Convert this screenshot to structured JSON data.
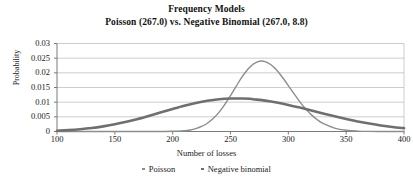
{
  "chart_data": {
    "type": "line",
    "title": "Frequency Models",
    "subtitle": "Poisson (267.0) vs. Negative Binomial (267.0, 8.8)",
    "xlabel": "Number of losses",
    "ylabel": "Probability",
    "xlim": [
      100,
      400
    ],
    "ylim": [
      0,
      0.03
    ],
    "xticks": [
      100,
      150,
      200,
      250,
      300,
      350,
      400
    ],
    "yticks": [
      0,
      0.005,
      0.01,
      0.015,
      0.02,
      0.025,
      0.03
    ],
    "ytick_labels": [
      "0",
      "0.005",
      "0.01",
      "0.015",
      "0.02",
      "0.025",
      "0.03"
    ],
    "xtick_labels": [
      "100",
      "150",
      "200",
      "250",
      "300",
      "350",
      "400"
    ],
    "grid": "horizontal",
    "legend_position": "bottom",
    "series": [
      {
        "name": "Poisson",
        "color": "#8d8d8d",
        "linewidth": 1.4,
        "mean": 267.0,
        "peak_x": 267,
        "peak_y": 0.0245,
        "x": [
          100,
          110,
          120,
          130,
          140,
          150,
          160,
          170,
          180,
          190,
          200,
          205,
          210,
          215,
          220,
          225,
          230,
          235,
          240,
          245,
          250,
          255,
          260,
          265,
          267,
          270,
          275,
          280,
          285,
          290,
          295,
          300,
          305,
          310,
          315,
          320,
          325,
          330,
          340,
          350,
          360,
          370,
          380,
          390,
          400
        ],
        "y": [
          0.0,
          0.0,
          0.0,
          0.0,
          0.0,
          0.0,
          0.0,
          0.0,
          0.0,
          1e-05,
          6e-05,
          0.00013,
          0.00027,
          0.00053,
          0.00098,
          0.00171,
          0.00282,
          0.00441,
          0.00653,
          0.00917,
          0.01223,
          0.01548,
          0.01861,
          0.02124,
          0.02199,
          0.02306,
          0.02395,
          0.02383,
          0.02275,
          0.02087,
          0.01841,
          0.01564,
          0.01281,
          0.01012,
          0.00771,
          0.00567,
          0.00402,
          0.00275,
          0.00117,
          0.00043,
          0.00014,
          4e-05,
          1e-05,
          0.0,
          0.0
        ]
      },
      {
        "name": "Negative binomial",
        "color": "#6f6f6f",
        "linewidth": 2.6,
        "mean": 267.0,
        "dispersion": 8.8,
        "peak_x": 267,
        "peak_y": 0.0112,
        "x": [
          100,
          110,
          120,
          130,
          140,
          150,
          160,
          170,
          180,
          190,
          200,
          210,
          220,
          230,
          240,
          250,
          260,
          267,
          270,
          280,
          290,
          300,
          310,
          320,
          330,
          340,
          350,
          360,
          370,
          380,
          390,
          400
        ],
        "y": [
          0.00028,
          0.00048,
          0.00078,
          0.00119,
          0.00175,
          0.00245,
          0.00331,
          0.0043,
          0.0054,
          0.00655,
          0.0077,
          0.00879,
          0.00974,
          0.01049,
          0.011,
          0.01125,
          0.01124,
          0.01114,
          0.01099,
          0.01052,
          0.00987,
          0.00906,
          0.00815,
          0.00717,
          0.00617,
          0.00519,
          0.00427,
          0.00343,
          0.0027,
          0.00207,
          0.00155,
          0.00114
        ]
      }
    ]
  },
  "legend": {
    "items": [
      {
        "label": "Poisson",
        "color": "#8d8d8d"
      },
      {
        "label": "Negative binomial",
        "color": "#6f6f6f"
      }
    ]
  },
  "axes": {
    "axis_color": "#7a7a7a",
    "grid_color": "#b8b8b8"
  }
}
